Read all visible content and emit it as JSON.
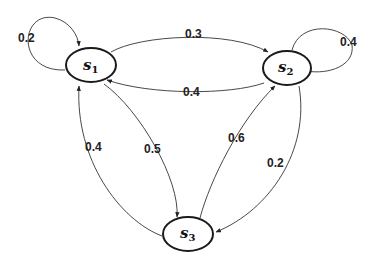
{
  "diagram": {
    "type": "state-transition-diagram",
    "nodes": [
      {
        "id": "s1",
        "label": "s",
        "subscript": "1"
      },
      {
        "id": "s2",
        "label": "s",
        "subscript": "2"
      },
      {
        "id": "s3",
        "label": "s",
        "subscript": "3"
      }
    ],
    "edges": [
      {
        "from": "s1",
        "to": "s1",
        "label": "0.2"
      },
      {
        "from": "s1",
        "to": "s2",
        "label": "0.3"
      },
      {
        "from": "s2",
        "to": "s1",
        "label": "0.4"
      },
      {
        "from": "s2",
        "to": "s2",
        "label": "0.4"
      },
      {
        "from": "s3",
        "to": "s1",
        "label": "0.4"
      },
      {
        "from": "s1",
        "to": "s3",
        "label": "0.5"
      },
      {
        "from": "s3",
        "to": "s2",
        "label": "0.6"
      },
      {
        "from": "s2",
        "to": "s3",
        "label": "0.2"
      }
    ]
  }
}
